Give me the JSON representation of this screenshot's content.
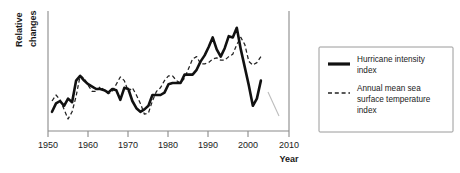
{
  "chart_data": {
    "type": "line",
    "title": "",
    "xlabel": "Year",
    "ylabel": "Relative changes",
    "xlim": [
      1950,
      2010
    ],
    "ylim": [
      0,
      100
    ],
    "grid": false,
    "y_axis_ticks_shown": false,
    "legend_position": "right-outside",
    "xticks": [
      1950,
      1960,
      1970,
      1980,
      1990,
      2000,
      2010
    ],
    "xtick_labels": [
      "1950",
      "1960",
      "1970",
      "1980",
      "1990",
      "2000",
      "2010"
    ],
    "series": [
      {
        "name": "Hurricane intensity index",
        "style": "solid",
        "color": "#111111",
        "x": [
          1951,
          1952,
          1953,
          1954,
          1955,
          1956,
          1957,
          1958,
          1959,
          1960,
          1961,
          1962,
          1963,
          1964,
          1965,
          1966,
          1967,
          1968,
          1969,
          1970,
          1971,
          1972,
          1973,
          1974,
          1975,
          1976,
          1977,
          1978,
          1979,
          1980,
          1981,
          1982,
          1983,
          1984,
          1985,
          1986,
          1987,
          1988,
          1989,
          1990,
          1991,
          1992,
          1993,
          1994,
          1995,
          1996,
          1997,
          1998,
          1999,
          2000,
          2001,
          2002,
          2003
        ],
        "values": [
          16,
          23,
          25,
          21,
          27,
          24,
          42,
          46,
          42,
          39,
          37,
          35,
          35,
          34,
          32,
          35,
          34,
          26,
          36,
          35,
          25,
          19,
          16,
          18,
          21,
          30,
          30,
          30,
          32,
          39,
          40,
          40,
          40,
          47,
          47,
          47,
          51,
          58,
          63,
          70,
          78,
          68,
          62,
          69,
          79,
          78,
          86,
          68,
          53,
          38,
          21,
          27,
          42
        ],
        "note": "Relative index, unitless; y-axis unlabeled"
      },
      {
        "name": "Annual mean sea surface temperature index",
        "style": "dashed",
        "color": "#222222",
        "x": [
          1951,
          1952,
          1953,
          1954,
          1955,
          1956,
          1957,
          1958,
          1959,
          1960,
          1961,
          1962,
          1963,
          1964,
          1965,
          1966,
          1967,
          1968,
          1969,
          1970,
          1971,
          1972,
          1973,
          1974,
          1975,
          1976,
          1977,
          1978,
          1979,
          1980,
          1981,
          1982,
          1983,
          1984,
          1985,
          1986,
          1987,
          1988,
          1989,
          1990,
          1991,
          1992,
          1993,
          1994,
          1995,
          1996,
          1997,
          1998,
          1999,
          2000,
          2001,
          2002,
          2003
        ],
        "values": [
          25,
          30,
          26,
          18,
          10,
          16,
          29,
          46,
          44,
          38,
          33,
          33,
          37,
          34,
          31,
          33,
          39,
          45,
          42,
          33,
          36,
          30,
          23,
          14,
          15,
          25,
          33,
          36,
          42,
          46,
          46,
          42,
          40,
          44,
          52,
          60,
          62,
          56,
          56,
          57,
          60,
          61,
          59,
          59,
          62,
          64,
          72,
          78,
          72,
          58,
          55,
          57,
          62
        ],
        "note": "Relative index, unitless; y-axis unlabeled"
      }
    ]
  },
  "legend": {
    "items": [
      {
        "label": "Hurricane intensity index",
        "style": "solid"
      },
      {
        "label": "Annual mean sea surface temperature index",
        "style": "dashed"
      }
    ],
    "entry_1_line_1": "Hurricane intensity",
    "entry_1_line_2": "index",
    "entry_2_line_1": "Annual mean sea",
    "entry_2_line_2": "surface temperature",
    "entry_2_line_3": "index"
  },
  "axes": {
    "ylabel_line_1": "Relative",
    "ylabel_line_2": "changes",
    "xlabel": "Year",
    "tick_1": "1950",
    "tick_2": "1960",
    "tick_3": "1970",
    "tick_4": "1980",
    "tick_5": "1990",
    "tick_6": "2000",
    "tick_7": "2010"
  },
  "colors": {
    "solid_series": "#111111",
    "dashed_series": "#222222",
    "axis": "#8a8a8a",
    "text": "#1a1a1a",
    "background": "#ffffff",
    "legend_border": "#9a9a9a"
  }
}
